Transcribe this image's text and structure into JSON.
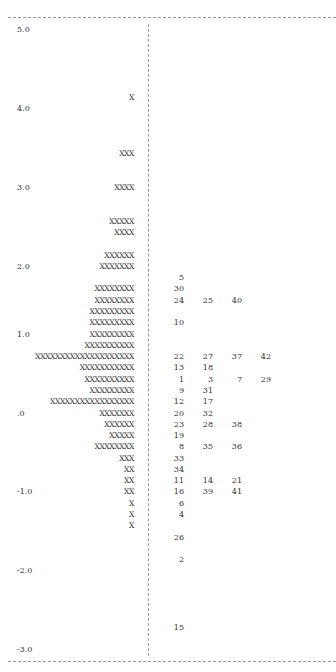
{
  "chart_data": {
    "type": "table",
    "ylabel": "Measure (logits)",
    "ylim": [
      -3.0,
      5.0
    ],
    "ticks": [
      "5.0",
      "4.0",
      "3.0",
      "2.0",
      "1.0",
      ".0",
      "-1.0",
      "-2.0",
      "-3.0"
    ],
    "legend": "Left: each X = person count at level; Right: item numbers",
    "rows": [
      {
        "row": 0,
        "label": "5.0",
        "bar": "",
        "items": []
      },
      {
        "row": 6,
        "label": "",
        "bar": "X",
        "items": []
      },
      {
        "row": 7,
        "label": "4.0",
        "bar": "",
        "items": []
      },
      {
        "row": 11,
        "label": "",
        "bar": "XXX",
        "items": []
      },
      {
        "row": 14,
        "label": "3.0",
        "bar": "XXXX",
        "items": []
      },
      {
        "row": 17,
        "label": "",
        "bar": "XXXXX",
        "items": []
      },
      {
        "row": 18,
        "label": "",
        "bar": "XXXX",
        "items": []
      },
      {
        "row": 20,
        "label": "",
        "bar": "XXXXXX",
        "items": []
      },
      {
        "row": 21,
        "label": "2.0",
        "bar": "XXXXXXX",
        "items": []
      },
      {
        "row": 22,
        "label": "",
        "bar": "",
        "items": [
          "5"
        ]
      },
      {
        "row": 23,
        "label": "",
        "bar": "XXXXXXXX",
        "items": [
          "30"
        ]
      },
      {
        "row": 24,
        "label": "",
        "bar": "XXXXXXXX",
        "items": [
          "24",
          "25",
          "40"
        ]
      },
      {
        "row": 25,
        "label": "",
        "bar": "XXXXXXXXX",
        "items": []
      },
      {
        "row": 26,
        "label": "",
        "bar": "XXXXXXXXX",
        "items": [
          "10"
        ]
      },
      {
        "row": 27,
        "label": "1.0",
        "bar": "XXXXXXXXX",
        "items": []
      },
      {
        "row": 28,
        "label": "",
        "bar": "XXXXXXXXXX",
        "items": []
      },
      {
        "row": 29,
        "label": "",
        "bar": "XXXXXXXXXXXXXXXXXXXX",
        "items": [
          "22",
          "27",
          "37",
          "42"
        ]
      },
      {
        "row": 30,
        "label": "",
        "bar": "XXXXXXXXXXX",
        "items": [
          "13",
          "18"
        ]
      },
      {
        "row": 31,
        "label": "",
        "bar": "XXXXXXXXXX",
        "items": [
          "1",
          "3",
          "7",
          "29"
        ]
      },
      {
        "row": 32,
        "label": "",
        "bar": "XXXXXXXXX",
        "items": [
          "9",
          "31"
        ]
      },
      {
        "row": 33,
        "label": "",
        "bar": "XXXXXXXXXXXXXXXXX",
        "items": [
          "12",
          "17"
        ]
      },
      {
        "row": 34,
        "label": ".0",
        "bar": "XXXXXXX",
        "items": [
          "20",
          "32"
        ]
      },
      {
        "row": 35,
        "label": "",
        "bar": "XXXXXX",
        "items": [
          "23",
          "28",
          "38"
        ]
      },
      {
        "row": 36,
        "label": "",
        "bar": "XXXXX",
        "items": [
          "19"
        ]
      },
      {
        "row": 37,
        "label": "",
        "bar": "XXXXXXXX",
        "items": [
          "8",
          "35",
          "36"
        ]
      },
      {
        "row": 38,
        "label": "",
        "bar": "XXX",
        "items": [
          "33"
        ]
      },
      {
        "row": 39,
        "label": "",
        "bar": "XX",
        "items": [
          "34"
        ]
      },
      {
        "row": 40,
        "label": "",
        "bar": "XX",
        "items": [
          "11",
          "14",
          "21"
        ]
      },
      {
        "row": 41,
        "label": "-1.0",
        "bar": "XX",
        "items": [
          "16",
          "39",
          "41"
        ]
      },
      {
        "row": 42,
        "label": "",
        "bar": "X",
        "items": [
          "6"
        ]
      },
      {
        "row": 43,
        "label": "",
        "bar": "X",
        "items": [
          "4"
        ]
      },
      {
        "row": 44,
        "label": "",
        "bar": "X",
        "items": []
      },
      {
        "row": 45,
        "label": "",
        "bar": "",
        "items": [
          "26"
        ]
      },
      {
        "row": 47,
        "label": "",
        "bar": "",
        "items": [
          "2"
        ]
      },
      {
        "row": 48,
        "label": "-2.0",
        "bar": "",
        "items": []
      },
      {
        "row": 53,
        "label": "",
        "bar": "",
        "items": [
          "15"
        ]
      },
      {
        "row": 55,
        "label": "-3.0",
        "bar": "",
        "items": []
      }
    ]
  },
  "layout": {
    "row_pitch_px": 11.28,
    "first_row_top_px": 24
  }
}
